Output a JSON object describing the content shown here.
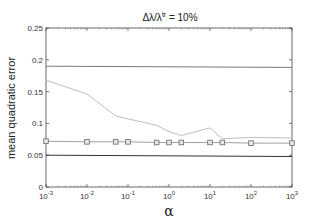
{
  "chart_data": {
    "type": "line",
    "title_parts": {
      "base": "Δλ/λ",
      "sup": "tr",
      "rest": " = 10%"
    },
    "xlabel": "α",
    "ylabel": "mean quadratic error",
    "xscale": "log",
    "xlim": [
      0.001,
      1000
    ],
    "ylim": [
      0,
      0.25
    ],
    "grid": false,
    "legend": null,
    "x_ticks": [
      {
        "value": 0.001,
        "base": "10",
        "exp": "-3"
      },
      {
        "value": 0.01,
        "base": "10",
        "exp": "-2"
      },
      {
        "value": 0.1,
        "base": "10",
        "exp": "-1"
      },
      {
        "value": 1,
        "base": "10",
        "exp": "0"
      },
      {
        "value": 10,
        "base": "10",
        "exp": "1"
      },
      {
        "value": 100,
        "base": "10",
        "exp": "2"
      },
      {
        "value": 1000,
        "base": "10",
        "exp": "3"
      }
    ],
    "y_ticks": [
      {
        "value": 0,
        "label": "0"
      },
      {
        "value": 0.05,
        "label": "0.05"
      },
      {
        "value": 0.1,
        "label": "0.1"
      },
      {
        "value": 0.15,
        "label": "0.15"
      },
      {
        "value": 0.2,
        "label": "0.2"
      },
      {
        "value": 0.25,
        "label": "0.25"
      }
    ],
    "series": [
      {
        "name": "upper constant",
        "color": "#777777",
        "marker": "none",
        "x": [
          0.001,
          1000
        ],
        "y": [
          0.19,
          0.188
        ]
      },
      {
        "name": "descending curve",
        "color": "#bdbdbd",
        "marker": "none",
        "x": [
          0.001,
          0.01,
          0.05,
          0.1,
          0.5,
          1,
          2,
          10,
          20,
          100,
          1000
        ],
        "y": [
          0.168,
          0.146,
          0.112,
          0.107,
          0.097,
          0.087,
          0.081,
          0.093,
          0.076,
          0.078,
          0.077
        ]
      },
      {
        "name": "squares",
        "color": "#888888",
        "marker": "square",
        "x": [
          0.001,
          0.01,
          0.05,
          0.1,
          0.5,
          1,
          2,
          10,
          20,
          100,
          1000
        ],
        "y": [
          0.072,
          0.071,
          0.071,
          0.071,
          0.07,
          0.07,
          0.07,
          0.07,
          0.07,
          0.069,
          0.069
        ]
      },
      {
        "name": "lower constant",
        "color": "#333333",
        "marker": "none",
        "x": [
          0.001,
          1000
        ],
        "y": [
          0.05,
          0.048
        ]
      }
    ]
  }
}
